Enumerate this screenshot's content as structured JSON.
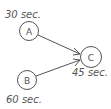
{
  "colors": {
    "stroke": "#555555",
    "background": "#ffffff"
  },
  "nodes": [
    {
      "id": "A",
      "label": "A",
      "duration": "30 sec."
    },
    {
      "id": "B",
      "label": "B",
      "duration": "60 sec."
    },
    {
      "id": "C",
      "label": "C",
      "duration": "45 sec."
    }
  ],
  "edges": [
    {
      "from": "A",
      "to": "C"
    },
    {
      "from": "B",
      "to": "C"
    }
  ]
}
